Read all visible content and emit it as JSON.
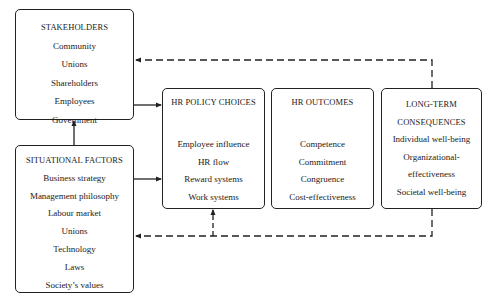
{
  "diagram": {
    "type": "flow-model",
    "boxes": {
      "stakeholders": {
        "title": "STAKEHOLDERS",
        "items": [
          "Community",
          "Unions",
          "Shareholders",
          "Employees",
          "Government"
        ]
      },
      "situational": {
        "title": "SITUATIONAL FACTORS",
        "items": [
          "Business strategy",
          "Management philosophy",
          "Labour market",
          "Unions",
          "Technology",
          "Laws",
          "Society’s values"
        ]
      },
      "policy": {
        "title": "HR POLICY CHOICES",
        "items": [
          "Employee influence",
          "HR flow",
          "Reward systems",
          "Work systems"
        ]
      },
      "outcomes": {
        "title": "HR OUTCOMES",
        "items": [
          "Competence",
          "Commitment",
          "Congruence",
          "Cost-effectiveness"
        ]
      },
      "consequences": {
        "title_lines": [
          "LONG-TERM",
          "CONSEQUENCES"
        ],
        "items": [
          "Individual well-being",
          "Organizational-",
          "effectiveness",
          "Societal well-being"
        ]
      }
    },
    "connectors": [
      {
        "from": "situational",
        "to": "stakeholders",
        "style": "solid",
        "arrow": "end"
      },
      {
        "from": "stakeholders",
        "to": "policy",
        "style": "solid",
        "arrow": "end"
      },
      {
        "from": "situational",
        "to": "policy",
        "style": "solid",
        "arrow": "end"
      },
      {
        "from": "consequences",
        "to": "stakeholders",
        "style": "dashed",
        "arrow": "end"
      },
      {
        "from": "consequences",
        "to": "situational",
        "style": "dashed",
        "arrow": "end"
      },
      {
        "from": "consequences",
        "to": "policy",
        "style": "dashed",
        "arrow": "end"
      }
    ],
    "colors": {
      "stroke": "#222222",
      "background": "#ffffff",
      "text": "#1a1a1a"
    }
  }
}
